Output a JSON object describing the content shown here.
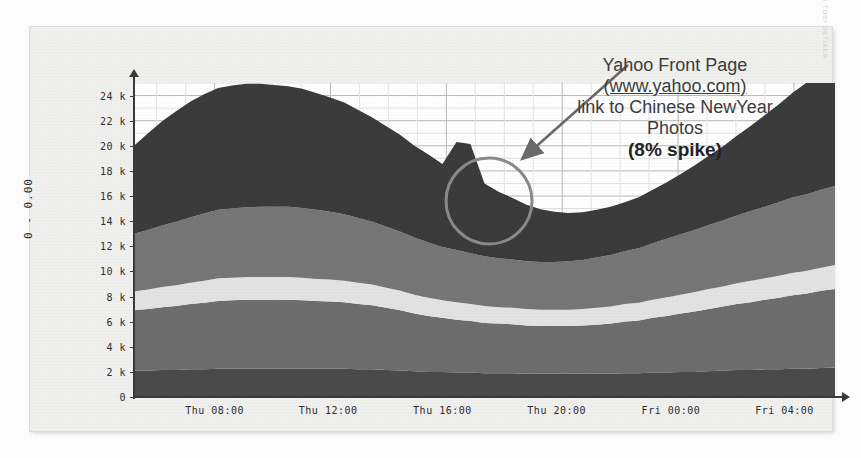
{
  "chart_data": {
    "type": "area",
    "title": "",
    "xlabel": "",
    "ylabel": "0 - 0.00",
    "ylim": [
      0,
      25000
    ],
    "yticks": [
      0,
      2000,
      4000,
      6000,
      8000,
      10000,
      12000,
      14000,
      16000,
      18000,
      20000,
      22000,
      24000
    ],
    "ytick_labels": [
      "0",
      "2 k",
      "4 k",
      "6 k",
      "8 k",
      "10 k",
      "12 k",
      "14 k",
      "16 k",
      "18 k",
      "20 k",
      "22 k",
      "24 k"
    ],
    "xtick_labels": [
      "Thu 08:00",
      "Thu 12:00",
      "Thu 16:00",
      "Thu 20:00",
      "Fri 00:00",
      "Fri 04:00"
    ],
    "xtick_positions": [
      0.115,
      0.277,
      0.44,
      0.603,
      0.766,
      0.928
    ],
    "grid": true,
    "legend": "none",
    "stacked": true,
    "x": [
      0,
      1,
      2,
      3,
      4,
      5,
      6,
      7,
      8,
      9,
      10,
      11,
      12,
      13,
      14,
      15,
      16,
      17,
      18,
      19,
      20,
      21,
      22,
      23,
      24,
      25,
      26,
      27,
      28,
      29,
      30,
      31,
      32,
      33,
      34,
      35,
      36,
      37,
      38,
      39,
      40,
      41,
      42,
      43,
      44,
      45,
      46,
      47,
      48,
      49,
      50
    ],
    "series": [
      {
        "name": "band-1-bottom",
        "color": "#4a4a4a",
        "values": [
          2100,
          2100,
          2150,
          2150,
          2200,
          2200,
          2250,
          2250,
          2250,
          2250,
          2250,
          2250,
          2250,
          2250,
          2250,
          2250,
          2200,
          2200,
          2150,
          2100,
          2050,
          2000,
          2000,
          1950,
          1950,
          1900,
          1900,
          1900,
          1850,
          1850,
          1850,
          1850,
          1850,
          1850,
          1850,
          1900,
          1900,
          1950,
          1950,
          2000,
          2000,
          2050,
          2100,
          2150,
          2150,
          2200,
          2200,
          2250,
          2250,
          2300,
          2350
        ]
      },
      {
        "name": "band-2",
        "color": "#6d6d6d",
        "values": [
          4800,
          4900,
          5000,
          5100,
          5200,
          5300,
          5400,
          5450,
          5500,
          5500,
          5500,
          5500,
          5450,
          5400,
          5350,
          5300,
          5200,
          5100,
          4950,
          4800,
          4600,
          4450,
          4300,
          4200,
          4100,
          4000,
          3950,
          3900,
          3850,
          3800,
          3800,
          3800,
          3850,
          3900,
          4000,
          4100,
          4200,
          4350,
          4500,
          4650,
          4800,
          4950,
          5100,
          5250,
          5400,
          5550,
          5700,
          5850,
          6000,
          6150,
          6250
        ]
      },
      {
        "name": "band-3-light",
        "color": "#e3e3e3",
        "values": [
          1500,
          1550,
          1600,
          1650,
          1700,
          1750,
          1800,
          1800,
          1800,
          1800,
          1800,
          1800,
          1800,
          1750,
          1750,
          1700,
          1700,
          1650,
          1600,
          1550,
          1500,
          1450,
          1400,
          1400,
          1350,
          1350,
          1300,
          1300,
          1300,
          1300,
          1300,
          1300,
          1300,
          1350,
          1350,
          1400,
          1400,
          1450,
          1500,
          1500,
          1550,
          1600,
          1600,
          1650,
          1700,
          1700,
          1750,
          1800,
          1800,
          1850,
          1900
        ]
      },
      {
        "name": "band-4",
        "color": "#767676",
        "values": [
          4600,
          4750,
          4900,
          5050,
          5200,
          5350,
          5450,
          5500,
          5550,
          5600,
          5600,
          5600,
          5550,
          5500,
          5400,
          5300,
          5150,
          5000,
          4850,
          4700,
          4550,
          4400,
          4250,
          4150,
          4050,
          3950,
          3900,
          3850,
          3800,
          3800,
          3800,
          3850,
          3900,
          4000,
          4100,
          4200,
          4350,
          4500,
          4650,
          4800,
          4950,
          5100,
          5250,
          5400,
          5550,
          5700,
          5850,
          6000,
          6100,
          6200,
          6300
        ]
      },
      {
        "name": "band-5-top",
        "color": "#3b3b3b",
        "values": [
          7000,
          7700,
          8300,
          8800,
          9200,
          9500,
          9700,
          9800,
          9850,
          9800,
          9700,
          9600,
          9500,
          9300,
          9100,
          8900,
          8600,
          8300,
          8000,
          7700,
          7300,
          7000,
          6600,
          8600,
          8700,
          5800,
          5300,
          4900,
          4500,
          4200,
          4000,
          3850,
          3800,
          3800,
          3850,
          3900,
          4050,
          4250,
          4500,
          4800,
          5150,
          5500,
          5900,
          6350,
          6800,
          7300,
          7800,
          8350,
          8900,
          9400,
          9900
        ]
      }
    ],
    "annotation": {
      "lines": [
        "Yahoo Front Page",
        "(www.yahoo.com)",
        "link to Chinese NewYear",
        "Photos"
      ],
      "url_line_index": 1,
      "emphasis": "(8% spike)",
      "highlight_shape": "circle",
      "pointer": "arrow"
    },
    "watermark": "RRDTOOL / TOBI OETIKER"
  },
  "annotation": {
    "line1": "Yahoo Front Page",
    "line2": "(www.yahoo.com)",
    "line3": "link to Chinese NewYear",
    "line4": "Photos",
    "line5": "(8% spike)"
  },
  "axes": {
    "ylabel": "0 - 0.00"
  },
  "watermark": {
    "text": "RRDTOOL / TOBI OETIKER"
  }
}
